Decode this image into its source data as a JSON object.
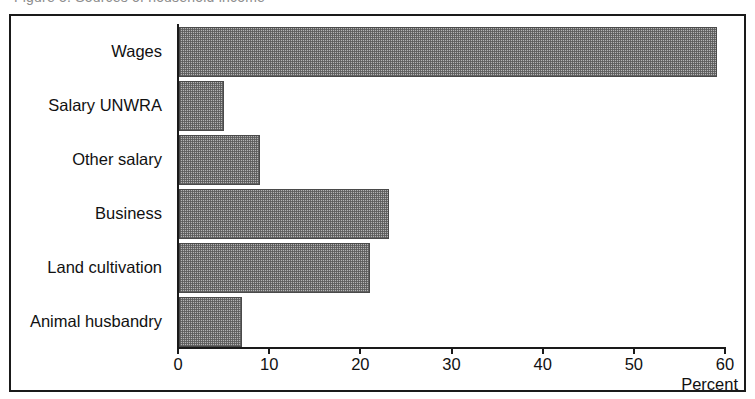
{
  "caption": {
    "text": "Figure 5.  Sources of household income"
  },
  "chart_data": {
    "type": "bar",
    "orientation": "horizontal",
    "title": "",
    "subtitle": "",
    "xlabel": "Percent",
    "ylabel": "",
    "categories": [
      "Wages",
      "Salary UNWRA",
      "Other salary",
      "Business",
      "Land cultivation",
      "Animal husbandry"
    ],
    "values": [
      59,
      4.9,
      8.9,
      23,
      21,
      6.9
    ],
    "xlim": [
      0,
      60
    ],
    "xticks": [
      0,
      10,
      20,
      30,
      40,
      50,
      60
    ],
    "xtick_labels": [
      "0",
      "10",
      "20",
      "30",
      "40",
      "50",
      "60"
    ],
    "grid": false,
    "legend": false,
    "bar_fill_color": "#b4b4b4",
    "bar_edge_color": "#4a4a4a",
    "axis_color": "#1a1a1a",
    "frame_color": "#1a1a1a",
    "background_color": "#ffffff"
  }
}
